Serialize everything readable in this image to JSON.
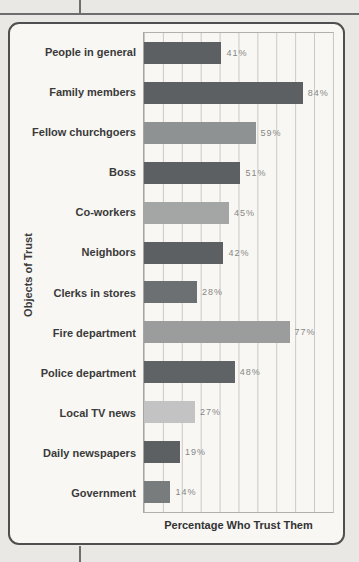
{
  "page": {
    "type": "scanned-textbook-figure"
  },
  "chart_data": {
    "type": "bar",
    "orientation": "horizontal",
    "title": "",
    "xlabel": "Percentage Who Trust Them",
    "ylabel": "Objects of Trust",
    "xlim": [
      0,
      100
    ],
    "grid": true,
    "gridline_interval": 10,
    "categories": [
      "People in general",
      "Family members",
      "Fellow churchgoers",
      "Boss",
      "Co-workers",
      "Neighbors",
      "Clerks in stores",
      "Fire department",
      "Police department",
      "Local TV news",
      "Daily newspapers",
      "Government"
    ],
    "values": [
      41,
      84,
      59,
      51,
      45,
      42,
      28,
      77,
      48,
      27,
      19,
      14
    ],
    "value_labels": [
      "41%",
      "84%",
      "59%",
      "51%",
      "45%",
      "42%",
      "28%",
      "77%",
      "48%",
      "27%",
      "19%",
      "14%"
    ],
    "bar_colors": [
      "#5d6062",
      "#5d6062",
      "#8f9293",
      "#5d6062",
      "#a4a6a6",
      "#5d6062",
      "#6d7072",
      "#9b9d9d",
      "#606365",
      "#c2c3c2",
      "#5d6062",
      "#797c7d"
    ]
  },
  "colors": {
    "page_background": "#e9e8e4",
    "figure_background": "#f8f7f3",
    "figure_border": "#4f4f4f",
    "grid_line": "#c9c9c6",
    "category_label_text": "#3a3a3a",
    "value_label_text": "#878787",
    "page_rule_line": "#6e6e6e"
  }
}
